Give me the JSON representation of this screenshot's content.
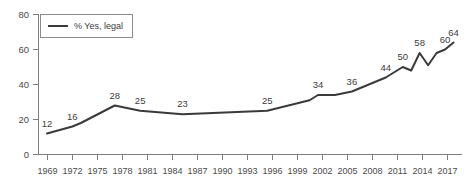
{
  "chart_data": {
    "type": "line",
    "title": "",
    "subtitle": "",
    "xlabel": "",
    "ylabel": "",
    "xlim": [
      1968,
      2018
    ],
    "ylim": [
      0,
      80
    ],
    "grid": false,
    "legend_position": "top-left",
    "y_ticks": [
      0,
      20,
      40,
      60,
      80
    ],
    "x_ticks": [
      1969,
      1972,
      1975,
      1978,
      1981,
      1984,
      1987,
      1990,
      1993,
      1996,
      1999,
      2002,
      2005,
      2008,
      2011,
      2014,
      2017
    ],
    "series": [
      {
        "name": "% Yes, legal",
        "color": "#3a3a3a",
        "x": [
          1969,
          1972,
          1973,
          1977,
          1980,
          1985,
          1995,
          2000,
          2001,
          2003,
          2005,
          2009,
          2011,
          2012,
          2013,
          2014,
          2015,
          2016,
          2017
        ],
        "values": [
          12,
          16,
          18,
          28,
          25,
          23,
          25,
          31,
          34,
          34,
          36,
          44,
          50,
          48,
          58,
          51,
          58,
          60,
          64
        ]
      }
    ],
    "annotations": [
      {
        "label": "12",
        "x": 1969,
        "y": 12
      },
      {
        "label": "16",
        "x": 1972,
        "y": 16
      },
      {
        "label": "28",
        "x": 1977,
        "y": 28
      },
      {
        "label": "25",
        "x": 1980,
        "y": 25
      },
      {
        "label": "23",
        "x": 1985,
        "y": 23
      },
      {
        "label": "25",
        "x": 1995,
        "y": 25
      },
      {
        "label": "34",
        "x": 2001,
        "y": 34
      },
      {
        "label": "36",
        "x": 2005,
        "y": 36
      },
      {
        "label": "44",
        "x": 2009,
        "y": 44
      },
      {
        "label": "50",
        "x": 2011,
        "y": 50
      },
      {
        "label": "58",
        "x": 2013,
        "y": 58
      },
      {
        "label": "60",
        "x": 2016,
        "y": 60
      },
      {
        "label": "64",
        "x": 2017,
        "y": 64
      }
    ]
  },
  "legend": {
    "entries": [
      {
        "label": "% Yes, legal",
        "color": "#3a3a3a"
      }
    ]
  },
  "axes": {
    "y_tick_labels": [
      "0",
      "20",
      "40",
      "60",
      "80"
    ],
    "x_tick_labels": [
      "1969",
      "1972",
      "1975",
      "1978",
      "1981",
      "1984",
      "1987",
      "1990",
      "1993",
      "1996",
      "1999",
      "2002",
      "2005",
      "2008",
      "2011",
      "2014",
      "2017"
    ]
  },
  "colors": {
    "line": "#3a3a3a",
    "axis": "#7d7d7d",
    "text": "#4a4a4a",
    "background": "#ffffff"
  }
}
